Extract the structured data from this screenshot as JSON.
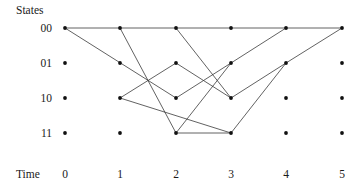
{
  "figure": {
    "states_axis_title": "States",
    "time_axis_title": "Time"
  },
  "chart_data": {
    "type": "diagram",
    "subtype": "trellis",
    "title": "",
    "xlabel": "Time",
    "ylabel": "States",
    "grid": false,
    "legend": null,
    "x": [
      0,
      1,
      2,
      3,
      4,
      5
    ],
    "x_tick_labels": [
      "0",
      "1",
      "2",
      "3",
      "4",
      "5"
    ],
    "y_tick_labels": [
      "00",
      "01",
      "10",
      "11"
    ],
    "states": [
      "00",
      "01",
      "10",
      "11"
    ],
    "node_pixel_columns": [
      65,
      120,
      176,
      231,
      286,
      342
    ],
    "node_pixel_rows": [
      28,
      63,
      98,
      133
    ],
    "nodes": [
      {
        "time": 0,
        "state": "00"
      },
      {
        "time": 0,
        "state": "01"
      },
      {
        "time": 0,
        "state": "10"
      },
      {
        "time": 0,
        "state": "11"
      },
      {
        "time": 1,
        "state": "00"
      },
      {
        "time": 1,
        "state": "01"
      },
      {
        "time": 1,
        "state": "10"
      },
      {
        "time": 1,
        "state": "11"
      },
      {
        "time": 2,
        "state": "00"
      },
      {
        "time": 2,
        "state": "01"
      },
      {
        "time": 2,
        "state": "10"
      },
      {
        "time": 2,
        "state": "11"
      },
      {
        "time": 3,
        "state": "00"
      },
      {
        "time": 3,
        "state": "01"
      },
      {
        "time": 3,
        "state": "10"
      },
      {
        "time": 3,
        "state": "11"
      },
      {
        "time": 4,
        "state": "00"
      },
      {
        "time": 4,
        "state": "01"
      },
      {
        "time": 4,
        "state": "10"
      },
      {
        "time": 4,
        "state": "11"
      },
      {
        "time": 5,
        "state": "00"
      },
      {
        "time": 5,
        "state": "01"
      },
      {
        "time": 5,
        "state": "10"
      },
      {
        "time": 5,
        "state": "11"
      }
    ],
    "edges": [
      {
        "from_time": 0,
        "from_state": "00",
        "to_time": 1,
        "to_state": "00"
      },
      {
        "from_time": 0,
        "from_state": "00",
        "to_time": 2,
        "to_state": "10"
      },
      {
        "from_time": 1,
        "from_state": "00",
        "to_time": 2,
        "to_state": "00"
      },
      {
        "from_time": 1,
        "from_state": "00",
        "to_time": 2,
        "to_state": "11"
      },
      {
        "from_time": 1,
        "from_state": "10",
        "to_time": 2,
        "to_state": "01"
      },
      {
        "from_time": 1,
        "from_state": "10",
        "to_time": 3,
        "to_state": "11"
      },
      {
        "from_time": 2,
        "from_state": "00",
        "to_time": 3,
        "to_state": "00"
      },
      {
        "from_time": 2,
        "from_state": "00",
        "to_time": 3,
        "to_state": "10"
      },
      {
        "from_time": 2,
        "from_state": "01",
        "to_time": 3,
        "to_state": "10"
      },
      {
        "from_time": 2,
        "from_state": "10",
        "to_time": 3,
        "to_state": "01"
      },
      {
        "from_time": 2,
        "from_state": "11",
        "to_time": 3,
        "to_state": "11"
      },
      {
        "from_time": 2,
        "from_state": "11",
        "to_time": 3,
        "to_state": "01"
      },
      {
        "from_time": 3,
        "from_state": "00",
        "to_time": 4,
        "to_state": "00"
      },
      {
        "from_time": 3,
        "from_state": "01",
        "to_time": 4,
        "to_state": "00"
      },
      {
        "from_time": 3,
        "from_state": "10",
        "to_time": 4,
        "to_state": "01"
      },
      {
        "from_time": 3,
        "from_state": "11",
        "to_time": 4,
        "to_state": "01"
      },
      {
        "from_time": 4,
        "from_state": "00",
        "to_time": 5,
        "to_state": "00"
      },
      {
        "from_time": 4,
        "from_state": "01",
        "to_time": 5,
        "to_state": "00"
      }
    ],
    "colors": {
      "edge": "#3a3a3a",
      "node": "#111111",
      "text": "#1a1a1a",
      "background": "#ffffff"
    }
  }
}
